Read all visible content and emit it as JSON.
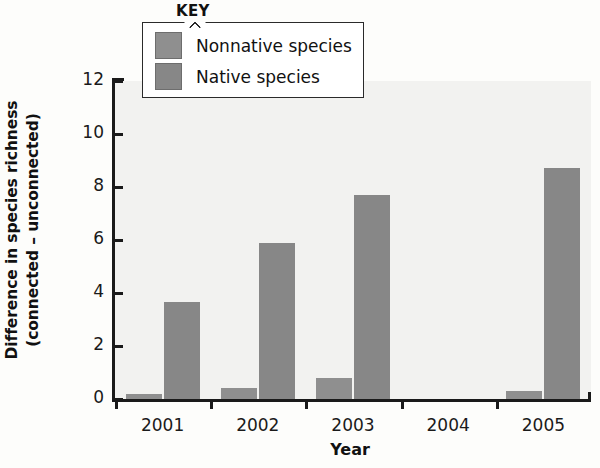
{
  "chart_data": {
    "type": "bar",
    "title": "",
    "xlabel": "Year",
    "ylabel": "Difference in species richness (connected – unconnected)",
    "ylabel_line1": "Difference in species richness",
    "ylabel_line2": "(connected – unconnected)",
    "categories": [
      "2001",
      "2002",
      "2003",
      "2004",
      "2005"
    ],
    "series": [
      {
        "name": "Nonnative species",
        "color": "#8f8f8f",
        "values": [
          0.2,
          0.4,
          0.8,
          0.0,
          0.3
        ]
      },
      {
        "name": "Native species",
        "color": "#878787",
        "values": [
          3.65,
          5.9,
          7.7,
          0.0,
          8.7
        ]
      }
    ],
    "ylim": [
      0,
      12
    ],
    "yticks": [
      "0",
      "2",
      "4",
      "6",
      "8",
      "10",
      "12"
    ],
    "ytick_values": [
      0,
      2,
      4,
      6,
      8,
      10,
      12
    ],
    "grid": false,
    "legend_position": "top-center",
    "legend_title": "KEY"
  },
  "ghost_lines": [
    "and the control plots. For the eight",
    "tive richness was also greater in the",
    "The fact that both native and nonnative",
    "richness did not necessarily result in",
    "greater nonnative species richness may",
    "such as the number of seeds arriving",
    "that was greater there than elsewhere",
    "",
    "than did unconnected patches but",
    "nonnative species richness was not"
  ]
}
